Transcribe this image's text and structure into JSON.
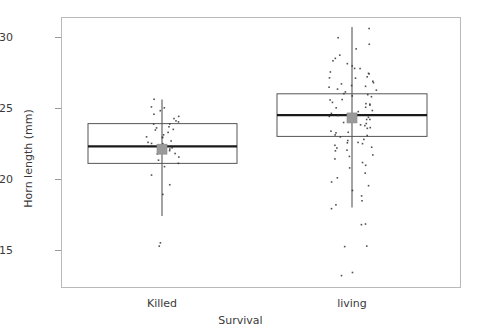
{
  "chart_data": {
    "type": "box",
    "title": "",
    "xlabel": "Survival",
    "ylabel": "Horn length (mm)",
    "ylim": [
      13.0,
      31.3
    ],
    "yticks": [
      15,
      20,
      25,
      30
    ],
    "ytick_labels": [
      "15",
      "20",
      "25",
      "30"
    ],
    "categories": [
      "Killed",
      "living"
    ],
    "grid": false,
    "legend": "none",
    "overlay": "jittered points (strip chart)",
    "mean_marker": "gray filled square",
    "boxes": [
      {
        "category": "Killed",
        "whisker_low": 17.4,
        "q1": 21.1,
        "median": 22.3,
        "q3": 23.9,
        "whisker_high": 25.6,
        "mean": 22.1,
        "outliers": [
          15.6,
          15.4,
          15.3,
          15.2
        ],
        "n_points": 40
      },
      {
        "category": "living",
        "whisker_low": 18.0,
        "q1": 23.0,
        "median": 24.5,
        "q3": 26.0,
        "whisker_high": 30.7,
        "mean": 24.3,
        "outliers": [
          16.9,
          16.8,
          15.4,
          15.3,
          13.4,
          13.3
        ],
        "n_points": 160
      }
    ],
    "points": {
      "Killed": [
        25.6,
        25.1,
        25.0,
        24.9,
        24.6,
        24.5,
        24.3,
        24.2,
        24.1,
        24.0,
        23.9,
        23.8,
        23.7,
        23.6,
        23.5,
        23.4,
        23.2,
        23.1,
        23.0,
        22.9,
        22.8,
        22.7,
        22.6,
        22.5,
        22.4,
        22.3,
        22.2,
        22.1,
        22.0,
        21.9,
        21.8,
        21.6,
        21.4,
        21.2,
        20.9,
        20.4,
        19.6,
        18.9,
        15.6,
        15.3
      ],
      "living": [
        30.7,
        30.0,
        29.6,
        29.2,
        28.8,
        28.6,
        28.4,
        28.2,
        28.0,
        27.9,
        27.8,
        27.6,
        27.5,
        27.4,
        27.3,
        27.2,
        27.1,
        27.0,
        26.9,
        26.8,
        26.7,
        26.6,
        26.5,
        26.4,
        26.3,
        26.2,
        26.1,
        26.0,
        25.9,
        25.8,
        25.7,
        25.6,
        25.5,
        25.4,
        25.3,
        25.2,
        25.1,
        25.0,
        24.9,
        24.8,
        24.7,
        24.6,
        24.5,
        24.4,
        24.3,
        24.2,
        24.1,
        24.0,
        23.9,
        23.8,
        23.7,
        23.6,
        23.5,
        23.4,
        23.3,
        23.2,
        23.1,
        23.0,
        22.9,
        22.8,
        22.7,
        22.6,
        22.5,
        22.4,
        22.3,
        22.2,
        22.1,
        22.0,
        21.8,
        21.6,
        21.4,
        21.2,
        21.0,
        20.8,
        20.5,
        20.2,
        19.9,
        19.6,
        19.2,
        18.9,
        18.5,
        18.2,
        18.0,
        16.9,
        16.8,
        15.4,
        15.3,
        13.4,
        13.3
      ]
    },
    "colors": {
      "frame": "#b9b9b9",
      "box_outline": "#555555",
      "median_line": "#1a1a1a",
      "whisker": "#8c8c8c",
      "mean_marker": "#9a9a9a",
      "point": "#333333",
      "text": "#3a3a3a"
    },
    "geometry": {
      "plot_left": 61,
      "plot_right": 461,
      "plot_top": 17,
      "plot_bottom": 288,
      "y_at_15": 250,
      "y_at_30": 37,
      "box_killed_x": [
        88,
        237
      ],
      "box_living_x": [
        277,
        427
      ],
      "center_killed_x": 162,
      "center_living_x": 352
    }
  }
}
